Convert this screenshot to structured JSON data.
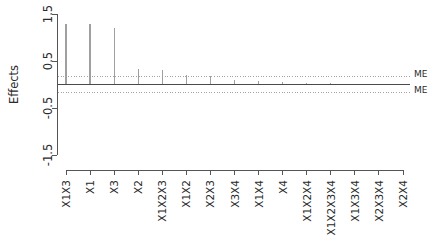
{
  "chart_data": {
    "type": "bar",
    "title": "",
    "subtitle": "",
    "xlabel": "",
    "ylabel": "Effects",
    "ylim": [
      -1.5,
      1.5
    ],
    "yticks": [
      1.5,
      0.5,
      -0.5,
      -1.5
    ],
    "ytick_labels": [
      "1.5",
      "0.5",
      "-0.5",
      "-1.5"
    ],
    "grid": false,
    "legend_position": "none",
    "categories": [
      "X1X3",
      "X1",
      "X3",
      "X2",
      "X1X2X3",
      "X1X2",
      "X2X3",
      "X3X4",
      "X1X4",
      "X4",
      "X1X2X4",
      "X1X2X3X4",
      "X1X3X4",
      "X2X3X4",
      "X2X4"
    ],
    "values": [
      1.28,
      1.28,
      1.2,
      0.33,
      0.3,
      0.21,
      0.19,
      0.1,
      0.07,
      0.05,
      0.04,
      0.03,
      0.02,
      0.02,
      0.01
    ],
    "annotations": [
      {
        "label": "ME",
        "value": 0.18,
        "style": "dotted-horizontal"
      },
      {
        "label": "ME",
        "value": -0.18,
        "style": "dotted-horizontal"
      }
    ],
    "zero_reference_line": 0
  },
  "axes": {
    "y_axis_title": "Effects",
    "y_tick_labels": [
      "1.5",
      "0.5",
      "-0.5",
      "-1.5"
    ]
  },
  "labels": {
    "me_upper": "ME",
    "me_lower": "ME"
  },
  "colors": {
    "spike": "#9f9f9f",
    "axis": "#555555",
    "zero_line": "#4a4a4a",
    "me_line": "#9a9a9a",
    "text": "#2b2b2b",
    "background": "#ffffff"
  }
}
